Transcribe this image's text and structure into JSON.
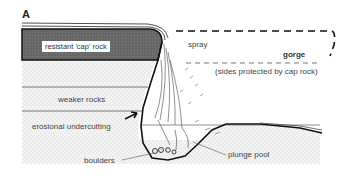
{
  "panel_label": "A",
  "labels": {
    "cap_rock": "resistant 'cap' rock",
    "spray": "spray",
    "gorge": "gorge",
    "gorge_note": "(sides protected by cap rock)",
    "weaker_rocks": "weaker rocks",
    "undercutting": "erosional undercutting",
    "boulders": "boulders",
    "plunge_pool": "plunge pool"
  },
  "colors": {
    "cap_rock_fill": "#6b6b6b",
    "stipple_bg": "#f1f1f1",
    "line": "#111111"
  }
}
